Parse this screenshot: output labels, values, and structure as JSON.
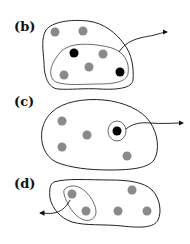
{
  "colors": {
    "gray_dot": "#8a8a8a",
    "black_dot": "#000000",
    "outline": "#222222"
  },
  "panels": [
    {
      "label": "(b)",
      "gray_dots": 5,
      "black_dots": 2,
      "arrow_direction": "out-right"
    },
    {
      "label": "(c)",
      "gray_dots": 4,
      "black_dots": 1,
      "arrow_direction": "out-right"
    },
    {
      "label": "(d)",
      "gray_dots": 5,
      "black_dots": 0,
      "arrow_direction": "out-left"
    }
  ]
}
